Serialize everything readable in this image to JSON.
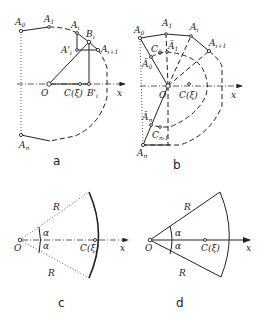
{
  "figure": {
    "panels": [
      {
        "id": "a",
        "caption": "a",
        "labels": {
          "A0": "A",
          "A0_sub": "0",
          "A1": "A",
          "A1_sub": "1",
          "Ai": "A",
          "Ai_sub": "i",
          "Bi": "B",
          "Bi_sub": "i",
          "Aip": "A",
          "Aip_sub": "i+1",
          "Api": "A'",
          "Api_sub": "i",
          "O": "O",
          "C": "C(ξ)",
          "Bpi": "B'",
          "Bpi_sub": "i",
          "x": "x",
          "An": "A",
          "An_sub": "n"
        }
      },
      {
        "id": "b",
        "caption": "b",
        "labels": {
          "A0": "A",
          "A0_sub": "0",
          "A1": "A",
          "A1_sub": "1",
          "Ai": "A",
          "Ai_sub": "i",
          "Aip": "A",
          "Aip_sub": "i+1",
          "C0": "C",
          "C0_sub": "0",
          "Abar1": "Ā",
          "Abar1_sub": "1",
          "Abar0": "Ā",
          "Abar0_sub": "0",
          "O": "O",
          "C": "C(ξ)",
          "x": "x",
          "Abarn": "Ā",
          "Abarn_sub": "n",
          "Cn1": "C",
          "Cn1_sub": "n-1",
          "An": "A",
          "An_sub": "n"
        }
      },
      {
        "id": "c",
        "caption": "c",
        "labels": {
          "R_top": "R",
          "R_bottom": "R",
          "alpha_top": "α",
          "alpha_bottom": "α",
          "O": "O",
          "C": "C(ξ)",
          "x": "x"
        }
      },
      {
        "id": "d",
        "caption": "d",
        "labels": {
          "R_top": "R",
          "R_bottom": "R",
          "alpha_top": "α",
          "alpha_bottom": "α",
          "O": "O",
          "C": "C(ξ)",
          "x": "x"
        }
      }
    ]
  }
}
